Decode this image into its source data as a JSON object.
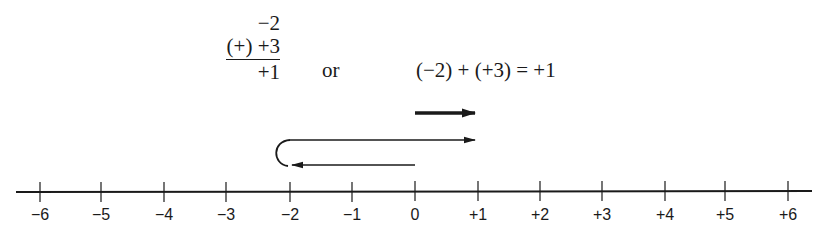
{
  "vertical_addition": {
    "addend1": "−2",
    "addend2": "(+) +3",
    "sum": "+1"
  },
  "connector": "or",
  "horizontal_equation": "(−2) + (+3) = +1",
  "number_line": {
    "min": -6,
    "max": 6,
    "ticks": [
      {
        "value": -6,
        "label": "−6",
        "x": 40
      },
      {
        "value": -5,
        "label": "−5",
        "x": 101
      },
      {
        "value": -4,
        "label": "−4",
        "x": 164
      },
      {
        "value": -3,
        "label": "−3",
        "x": 226
      },
      {
        "value": -2,
        "label": "−2",
        "x": 290
      },
      {
        "value": -1,
        "label": "−1",
        "x": 352
      },
      {
        "value": 0,
        "label": "0",
        "x": 415
      },
      {
        "value": 1,
        "label": "+1",
        "x": 478
      },
      {
        "value": 2,
        "label": "+2",
        "x": 540
      },
      {
        "value": 3,
        "label": "+3",
        "x": 602
      },
      {
        "value": 4,
        "label": "+4",
        "x": 665
      },
      {
        "value": 5,
        "label": "+5",
        "x": 725
      },
      {
        "value": 6,
        "label": "+6",
        "x": 788
      }
    ]
  },
  "arrows": [
    {
      "name": "result-arrow",
      "from": 0,
      "to": 1,
      "style": "thick"
    },
    {
      "name": "move-negative-2-arrow",
      "from": 0,
      "to": -2,
      "style": "thin"
    },
    {
      "name": "move-positive-3-arrow",
      "from": -2,
      "to": 1,
      "style": "thin"
    }
  ],
  "colors": {
    "ink": "#1a1a1a",
    "background": "#ffffff"
  }
}
